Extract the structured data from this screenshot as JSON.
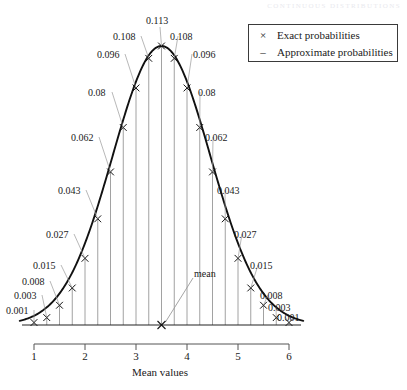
{
  "page": {
    "running_head": "CONTINUOUS DISTRIBUTIONS"
  },
  "legend": {
    "position": "top-right",
    "items": [
      {
        "symbol": "×",
        "label": "Exact probabilities",
        "name": "exact-probabilities"
      },
      {
        "symbol": "–",
        "label": "Approximate probabilities",
        "name": "approximate-probabilities"
      }
    ]
  },
  "annotation": {
    "mean_label": "mean",
    "mean_x": 3.5
  },
  "axis": {
    "xlabel": "Mean values",
    "xticks": [
      "1",
      "2",
      "3",
      "4",
      "5",
      "6"
    ],
    "xtick_values": [
      1,
      2,
      3,
      4,
      5,
      6
    ]
  },
  "chart_data": {
    "type": "line",
    "title": "",
    "subtitle": "",
    "xlabel": "Mean values",
    "ylabel": "",
    "xlim": [
      1,
      6
    ],
    "ylim": [
      0,
      0.113
    ],
    "grid": false,
    "legend_position": "top-right",
    "series": [
      {
        "name": "Exact probabilities",
        "marker": "×",
        "x": [
          1,
          1.25,
          1.5,
          1.75,
          2,
          2.25,
          2.5,
          2.75,
          3,
          3.25,
          3.5,
          3.75,
          4,
          4.25,
          4.5,
          4.75,
          5,
          5.25,
          5.5,
          5.75,
          6
        ],
        "values": [
          0.001,
          0.003,
          0.008,
          0.015,
          0.027,
          0.043,
          0.062,
          0.08,
          0.096,
          0.108,
          0.113,
          0.108,
          0.096,
          0.08,
          0.062,
          0.043,
          0.027,
          0.015,
          0.008,
          0.003,
          0.001
        ]
      },
      {
        "name": "Approximate probabilities",
        "marker": "–",
        "description": "smooth normal curve through the exact probabilities"
      }
    ],
    "point_labels": [
      "0.001",
      "0.003",
      "0.008",
      "0.015",
      "0.027",
      "0.043",
      "0.062",
      "0.08",
      "0.096",
      "0.108",
      "0.113",
      "0.108",
      "0.096",
      "0.08",
      "0.062",
      "0.043",
      "0.027",
      "0.015",
      "0.008",
      "0.003",
      "0.001"
    ],
    "annotations": [
      {
        "text": "mean",
        "x": 3.5,
        "y": 0
      }
    ]
  },
  "colors": {
    "curve": "#111111",
    "stem": "#8a8a8a",
    "axis": "#4a4a4a",
    "text": "#1a1a1a",
    "legend_border": "#3a3a3a"
  },
  "labels": {
    "left": [
      {
        "text": "0.001",
        "x": 6,
        "y": 306
      },
      {
        "text": "0.003",
        "x": 14,
        "y": 291
      },
      {
        "text": "0.008",
        "x": 22,
        "y": 277
      },
      {
        "text": "0.015",
        "x": 33,
        "y": 261
      },
      {
        "text": "0.027",
        "x": 46,
        "y": 230
      },
      {
        "text": "0.043",
        "x": 58,
        "y": 186
      },
      {
        "text": "0.062",
        "x": 71,
        "y": 133
      },
      {
        "text": "0.08",
        "x": 88,
        "y": 88
      },
      {
        "text": "0.096",
        "x": 97,
        "y": 50
      },
      {
        "text": "0.108",
        "x": 113,
        "y": 32
      },
      {
        "text": "0.113",
        "x": 146,
        "y": 16
      }
    ],
    "right": [
      {
        "text": "0.108",
        "x": 170,
        "y": 32
      },
      {
        "text": "0.096",
        "x": 193,
        "y": 50
      },
      {
        "text": "0.08",
        "x": 198,
        "y": 88
      },
      {
        "text": "0.062",
        "x": 205,
        "y": 133
      },
      {
        "text": "0.043",
        "x": 217,
        "y": 186
      },
      {
        "text": "0.027",
        "x": 234,
        "y": 230
      },
      {
        "text": "0.015",
        "x": 250,
        "y": 261
      },
      {
        "text": "0.008",
        "x": 260,
        "y": 291
      },
      {
        "text": "0.003",
        "x": 268,
        "y": 303
      },
      {
        "text": "0.001",
        "x": 277,
        "y": 313
      }
    ]
  }
}
